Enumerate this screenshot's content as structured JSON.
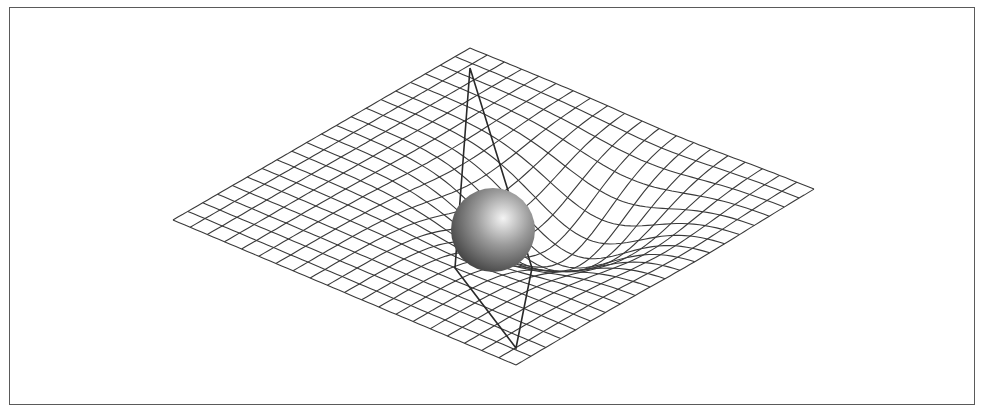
{
  "diagram": {
    "title": "",
    "colors": {
      "background": "#ffffff",
      "frame": "#5a5a5a",
      "grid_line": "#3a3a3a",
      "cone_line": "#2a2a2a",
      "sphere_highlight": "#f4f4f4",
      "sphere_mid": "#9a9a9a",
      "sphere_shadow": "#3c3c3c"
    },
    "grid": {
      "divisions": 20,
      "corners": {
        "top": [
          470,
          48
        ],
        "right": [
          814,
          189
        ],
        "bottom": [
          516,
          365
        ],
        "left": [
          173,
          220
        ]
      },
      "dip_depth": 62,
      "dip_width": 0.22,
      "dip_center": [
        0.62,
        0.6
      ]
    },
    "sphere": {
      "cx": 493,
      "cy": 230,
      "r": 42,
      "highlight": [
        506,
        214
      ]
    },
    "cone": {
      "points": [
        [
          470,
          68
        ],
        [
          455,
          268
        ],
        [
          516,
          348
        ],
        [
          532,
          268
        ],
        [
          470,
          68
        ]
      ]
    }
  }
}
